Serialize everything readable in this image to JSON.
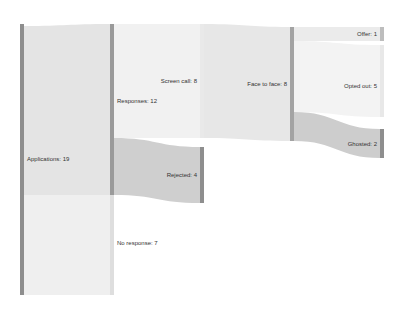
{
  "colors": {
    "node_dark": "#8f8f8f",
    "node_mid": "#a7a7a7",
    "flow_light": "#e6e6e6",
    "flow_lighter": "#efefef",
    "flow_dark": "#c4c4c4"
  },
  "nodes": [
    {
      "id": "applications",
      "label": "Applications: 19",
      "value": 19
    },
    {
      "id": "responses",
      "label": "Responses: 12",
      "value": 12
    },
    {
      "id": "no_response",
      "label": "No response: 7",
      "value": 7
    },
    {
      "id": "screen_call",
      "label": "Screen call: 8",
      "value": 8
    },
    {
      "id": "rejected",
      "label": "Rejected: 4",
      "value": 4
    },
    {
      "id": "face_to_face",
      "label": "Face to face: 8",
      "value": 8
    },
    {
      "id": "offer",
      "label": "Offer: 1",
      "value": 1
    },
    {
      "id": "opted_out",
      "label": "Opted out: 5",
      "value": 5
    },
    {
      "id": "ghosted",
      "label": "Ghosted: 2",
      "value": 2
    }
  ],
  "links": [
    {
      "source": "applications",
      "target": "responses",
      "value": 12
    },
    {
      "source": "applications",
      "target": "no_response",
      "value": 7
    },
    {
      "source": "responses",
      "target": "screen_call",
      "value": 8
    },
    {
      "source": "responses",
      "target": "rejected",
      "value": 4
    },
    {
      "source": "screen_call",
      "target": "face_to_face",
      "value": 8
    },
    {
      "source": "face_to_face",
      "target": "offer",
      "value": 1
    },
    {
      "source": "face_to_face",
      "target": "opted_out",
      "value": 5
    },
    {
      "source": "face_to_face",
      "target": "ghosted",
      "value": 2
    }
  ]
}
